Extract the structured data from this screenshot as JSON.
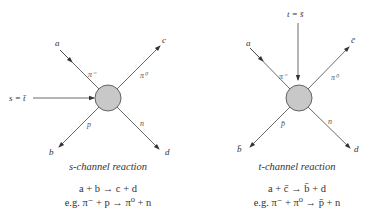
{
  "s_channel": {
    "caption": "s-channel reaction",
    "equation": "a + b → c + d",
    "example": "e.g. π⁻ + p → π⁰ + n",
    "energy_label": "s = t̄",
    "external_labels": {
      "a": "a",
      "b": "b",
      "c": "c",
      "d": "d"
    },
    "particle_labels": {
      "a": "π⁻",
      "b": "p",
      "c": "π⁰",
      "d": "n"
    }
  },
  "t_channel": {
    "caption": "t-channel reaction",
    "equation": "a + c̄ → b̄ + d",
    "example": "e.g. π⁻ + π⁰ → p̄ + n",
    "energy_label": "t = s̄",
    "external_labels": {
      "a": "a",
      "b": "b̄",
      "c": "c̄",
      "d": "d"
    },
    "particle_labels": {
      "a": "π⁻",
      "b": "p̄",
      "c": "π⁰",
      "d": "n"
    }
  },
  "colors": {
    "vertex_fill": "#c8c8c8",
    "vertex_stroke": "#555555",
    "line": "#444444"
  }
}
